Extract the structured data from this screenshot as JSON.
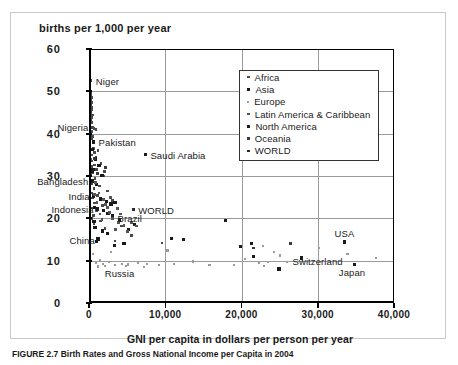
{
  "figure": {
    "caption": "FIGURE 2.7 Birth Rates and Gross National Income per Capita in 2004"
  },
  "chart_data": {
    "type": "scatter",
    "title": "births per 1,000 per year",
    "xlabel": "GNI per capita in dollars per person per year",
    "ylabel": "births per 1,000 per year",
    "xlim": [
      0,
      40000
    ],
    "ylim": [
      0,
      60
    ],
    "xticks": [
      0,
      10000,
      20000,
      30000,
      40000
    ],
    "xtick_labels": [
      "0",
      "10,000",
      "20,000",
      "30,000",
      "40,000"
    ],
    "yticks": [
      0,
      10,
      20,
      30,
      40,
      50,
      60
    ],
    "ytick_labels": [
      "0",
      "10",
      "20",
      "30",
      "40",
      "50",
      "60"
    ],
    "grid": "horizontal-and-vertical",
    "legend_position": "upper-right-inside",
    "legend": [
      {
        "name": "Africa",
        "marker": "small-square",
        "color": "#4a4a4a",
        "size": 2.6
      },
      {
        "name": "Asia",
        "marker": "square",
        "color": "#1a1a1a",
        "size": 3.4
      },
      {
        "name": "Europe",
        "marker": "tiny-square",
        "color": "#9b9b9b",
        "size": 2.2
      },
      {
        "name": "Latin America & Caribbean",
        "marker": "small-square",
        "color": "#555555",
        "size": 2.8
      },
      {
        "name": "North America",
        "marker": "square",
        "color": "#1a1a1a",
        "size": 3.4
      },
      {
        "name": "Oceania",
        "marker": "small-square",
        "color": "#3a3a3a",
        "size": 2.8
      },
      {
        "name": "WORLD",
        "marker": "small-square",
        "color": "#2a2a2a",
        "size": 2.8
      }
    ],
    "annotations": [
      {
        "label": "Niger",
        "x": 240,
        "y": 52.5,
        "align": "right"
      },
      {
        "label": "Nigeria",
        "x": 430,
        "y": 41.5,
        "align": "left"
      },
      {
        "label": "Pakistan",
        "x": 600,
        "y": 38.0,
        "align": "right"
      },
      {
        "label": "Saudi Arabia",
        "x": 7400,
        "y": 35.0,
        "align": "right"
      },
      {
        "label": "Bangladesh",
        "x": 440,
        "y": 28.8,
        "align": "left"
      },
      {
        "label": "India",
        "x": 620,
        "y": 25.3,
        "align": "left"
      },
      {
        "label": "Indonesia",
        "x": 1140,
        "y": 22.2,
        "align": "left"
      },
      {
        "label": "WORLD",
        "x": 5800,
        "y": 22.0,
        "align": "right"
      },
      {
        "label": "Brazil",
        "x": 3090,
        "y": 20.0,
        "align": "right"
      },
      {
        "label": "China",
        "x": 1290,
        "y": 15.0,
        "align": "left"
      },
      {
        "label": "USA",
        "x": 33500,
        "y": 16.5,
        "align": "center"
      },
      {
        "label": "Switzerland",
        "x": 33800,
        "y": 10.0,
        "align": "left"
      },
      {
        "label": "Japan",
        "x": 34500,
        "y": 7.4,
        "align": "center"
      },
      {
        "label": "Russia",
        "x": 1400,
        "y": 7.2,
        "align": "right"
      }
    ],
    "series": [
      {
        "name": "Africa",
        "color": "#4a4a4a",
        "size": 2.6,
        "points": [
          [
            240,
            52.5
          ],
          [
            280,
            50.0
          ],
          [
            200,
            49.3
          ],
          [
            300,
            48.6
          ],
          [
            260,
            48.0
          ],
          [
            340,
            47.4
          ],
          [
            220,
            46.8
          ],
          [
            380,
            46.2
          ],
          [
            290,
            45.6
          ],
          [
            250,
            45.0
          ],
          [
            430,
            44.4
          ],
          [
            310,
            43.8
          ],
          [
            200,
            43.2
          ],
          [
            360,
            42.6
          ],
          [
            430,
            41.5
          ],
          [
            640,
            41.2
          ],
          [
            900,
            41.0
          ],
          [
            320,
            40.5
          ],
          [
            260,
            40.0
          ],
          [
            480,
            39.4
          ],
          [
            300,
            38.8
          ],
          [
            1200,
            36.0
          ],
          [
            560,
            36.5
          ],
          [
            700,
            35.6
          ],
          [
            380,
            35.0
          ],
          [
            900,
            34.4
          ],
          [
            260,
            34.0
          ],
          [
            420,
            33.5
          ],
          [
            1600,
            33.0
          ],
          [
            700,
            32.6
          ],
          [
            330,
            32.2
          ],
          [
            1000,
            31.6
          ],
          [
            2000,
            31.0
          ],
          [
            480,
            30.8
          ],
          [
            240,
            30.4
          ],
          [
            1900,
            30.0
          ],
          [
            800,
            29.4
          ],
          [
            520,
            28.8
          ],
          [
            330,
            28.2
          ],
          [
            1400,
            27.6
          ],
          [
            640,
            27.0
          ],
          [
            2400,
            26.5
          ],
          [
            300,
            26.0
          ],
          [
            1100,
            25.4
          ],
          [
            460,
            24.8
          ],
          [
            3100,
            24.2
          ],
          [
            760,
            23.6
          ],
          [
            1800,
            23.0
          ],
          [
            420,
            22.4
          ],
          [
            980,
            21.8
          ],
          [
            2600,
            21.2
          ],
          [
            560,
            20.6
          ],
          [
            320,
            20.0
          ],
          [
            1500,
            19.4
          ],
          [
            680,
            18.8
          ],
          [
            4300,
            18.2
          ],
          [
            2100,
            17.6
          ],
          [
            5600,
            16.0
          ],
          [
            3400,
            14.6
          ],
          [
            9600,
            14.2
          ]
        ]
      },
      {
        "name": "Asia",
        "color": "#1a1a1a",
        "size": 3.3,
        "points": [
          [
            600,
            38.0
          ],
          [
            7400,
            35.0
          ],
          [
            460,
            36.2
          ],
          [
            820,
            34.0
          ],
          [
            1300,
            32.4
          ],
          [
            540,
            31.6
          ],
          [
            380,
            31.0
          ],
          [
            1700,
            30.2
          ],
          [
            440,
            28.8
          ],
          [
            960,
            28.0
          ],
          [
            620,
            25.3
          ],
          [
            1480,
            24.6
          ],
          [
            2300,
            24.0
          ],
          [
            2900,
            23.4
          ],
          [
            3400,
            23.8
          ],
          [
            1140,
            22.2
          ],
          [
            740,
            22.6
          ],
          [
            1900,
            21.8
          ],
          [
            2500,
            21.2
          ],
          [
            3100,
            20.6
          ],
          [
            4000,
            19.6
          ],
          [
            1290,
            15.0
          ],
          [
            1180,
            15.2
          ],
          [
            980,
            14.5
          ],
          [
            5200,
            17.3
          ],
          [
            4600,
            14.0
          ],
          [
            6000,
            18.6
          ],
          [
            10800,
            15.2
          ],
          [
            12400,
            15.0
          ],
          [
            17900,
            19.5
          ],
          [
            19900,
            13.4
          ],
          [
            21300,
            14.0
          ],
          [
            21600,
            11.0
          ],
          [
            24900,
            8.0
          ],
          [
            34800,
            9.1
          ],
          [
            3300,
            13.5
          ],
          [
            2400,
            16.4
          ],
          [
            800,
            17.8
          ],
          [
            1750,
            17.0
          ],
          [
            640,
            19.2
          ]
        ]
      },
      {
        "name": "Europe",
        "color": "#9b9b9b",
        "size": 2.2,
        "points": [
          [
            560,
            11.5
          ],
          [
            1400,
            10.2
          ],
          [
            900,
            9.4
          ],
          [
            1800,
            9.2
          ],
          [
            2600,
            9.6
          ],
          [
            3400,
            9.0
          ],
          [
            4300,
            9.3
          ],
          [
            2100,
            8.8
          ],
          [
            1150,
            8.6
          ],
          [
            5100,
            9.1
          ],
          [
            6400,
            9.5
          ],
          [
            7600,
            9.2
          ],
          [
            9200,
            9.0
          ],
          [
            11200,
            9.3
          ],
          [
            13600,
            9.8
          ],
          [
            2900,
            12.0
          ],
          [
            10300,
            12.4
          ],
          [
            15800,
            9.0
          ],
          [
            19000,
            8.9
          ],
          [
            22300,
            9.4
          ],
          [
            23500,
            9.6
          ],
          [
            22800,
            13.4
          ],
          [
            24300,
            12.0
          ],
          [
            25100,
            11.2
          ],
          [
            30200,
            13.0
          ],
          [
            33900,
            11.5
          ],
          [
            37600,
            10.6
          ],
          [
            23000,
            8.8
          ],
          [
            26000,
            9.7
          ],
          [
            20500,
            10.3
          ],
          [
            4800,
            8.7
          ],
          [
            7200,
            8.5
          ]
        ]
      },
      {
        "name": "Latin America & Caribbean",
        "color": "#555555",
        "size": 2.8,
        "points": [
          [
            3090,
            20.0
          ],
          [
            2400,
            22.6
          ],
          [
            1900,
            24.4
          ],
          [
            1300,
            26.0
          ],
          [
            2700,
            21.4
          ],
          [
            3900,
            19.0
          ],
          [
            4600,
            18.4
          ],
          [
            1700,
            19.8
          ],
          [
            900,
            28.4
          ],
          [
            2150,
            23.2
          ],
          [
            3500,
            17.4
          ],
          [
            5600,
            19.0
          ],
          [
            1050,
            23.8
          ],
          [
            6200,
            18.2
          ],
          [
            4100,
            21.0
          ],
          [
            2850,
            25.0
          ],
          [
            1450,
            21.0
          ],
          [
            760,
            25.6
          ],
          [
            3700,
            22.4
          ],
          [
            5000,
            16.8
          ]
        ]
      },
      {
        "name": "North America",
        "color": "#1a1a1a",
        "size": 3.4,
        "points": [
          [
            33500,
            14.4
          ],
          [
            27900,
            10.6
          ]
        ]
      },
      {
        "name": "Oceania",
        "color": "#3a3a3a",
        "size": 2.8,
        "points": [
          [
            21600,
            13.0
          ],
          [
            26400,
            14.0
          ],
          [
            2200,
            32.0
          ],
          [
            1100,
            30.6
          ],
          [
            680,
            34.2
          ]
        ]
      },
      {
        "name": "WORLD",
        "color": "#2a2a2a",
        "size": 2.9,
        "points": [
          [
            5800,
            22.0
          ]
        ]
      }
    ]
  }
}
